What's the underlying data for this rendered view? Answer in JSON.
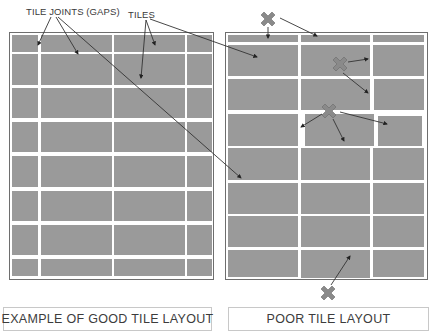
{
  "labels": {
    "tile_joints": "TILE JOINTS (GAPS)",
    "tiles": "TILES"
  },
  "captions": {
    "good": "EXAMPLE OF GOOD TILE LAYOUT",
    "poor": "POOR TILE LAYOUT"
  },
  "colors": {
    "tile": "#9a9a9a",
    "grout": "#ffffff",
    "frame": "#6e6e6e",
    "arrow": "#333333",
    "cross_mark": "#8a8a8a"
  },
  "markers": {
    "cross_icon": "x-mark-icon",
    "count": 4
  }
}
